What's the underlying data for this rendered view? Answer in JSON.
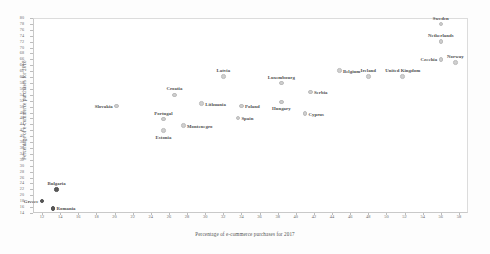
{
  "chart_data": {
    "type": "scatter",
    "title": "",
    "xlabel": "Percentage of e-commerce purchases for 2017",
    "ylabel": "Percentage of e-commerce purchases for 2018",
    "xlim": [
      11,
      59
    ],
    "ylim": [
      14,
      80
    ],
    "grid": false,
    "legend": null,
    "xticks": [
      12,
      14,
      16,
      18,
      20,
      22,
      24,
      26,
      28,
      30,
      32,
      34,
      36,
      38,
      40,
      42,
      44,
      46,
      48,
      50,
      52,
      54,
      56,
      58
    ],
    "yticks": [
      14,
      16,
      18,
      20,
      22,
      24,
      26,
      28,
      30,
      32,
      34,
      36,
      38,
      40,
      42,
      44,
      46,
      48,
      50,
      52,
      54,
      56,
      58,
      60,
      62,
      64,
      66,
      68,
      70,
      72,
      74,
      76,
      78,
      80
    ],
    "marker_color": "#cfcfcf",
    "label_color": "#4f4f4f",
    "points": [
      {
        "label": "Sweden",
        "x": 56.0,
        "y": 78.0,
        "pos": "above",
        "dark": false
      },
      {
        "label": "Netherlands",
        "x": 56.0,
        "y": 72.0,
        "pos": "above",
        "dark": false
      },
      {
        "label": "Czechia",
        "x": 56.0,
        "y": 66.0,
        "pos": "left",
        "dark": false
      },
      {
        "label": "Norway",
        "x": 57.6,
        "y": 65.0,
        "pos": "above",
        "dark": false
      },
      {
        "label": "United Kingdom",
        "x": 51.8,
        "y": 60.2,
        "pos": "above",
        "dark": false
      },
      {
        "label": "Ireland",
        "x": 48.0,
        "y": 60.2,
        "pos": "above",
        "dark": false
      },
      {
        "label": "Belgium",
        "x": 44.8,
        "y": 62.2,
        "pos": "right",
        "dark": false
      },
      {
        "label": "Luxembourg",
        "x": 38.4,
        "y": 58.0,
        "pos": "above",
        "dark": false
      },
      {
        "label": "Serbia",
        "x": 41.6,
        "y": 55.0,
        "pos": "right",
        "dark": false
      },
      {
        "label": "Hungary",
        "x": 38.4,
        "y": 51.6,
        "pos": "below",
        "dark": false
      },
      {
        "label": "Cyprus",
        "x": 41.0,
        "y": 47.6,
        "pos": "right",
        "dark": false
      },
      {
        "label": "Latvia",
        "x": 32.0,
        "y": 60.2,
        "pos": "above",
        "dark": false
      },
      {
        "label": "Croatia",
        "x": 26.6,
        "y": 54.0,
        "pos": "above",
        "dark": false
      },
      {
        "label": "Lithuania",
        "x": 29.6,
        "y": 51.0,
        "pos": "right",
        "dark": false
      },
      {
        "label": "Poland",
        "x": 34.0,
        "y": 50.2,
        "pos": "right",
        "dark": false
      },
      {
        "label": "Slovakia",
        "x": 20.2,
        "y": 50.2,
        "pos": "left",
        "dark": false
      },
      {
        "label": "Spain",
        "x": 33.6,
        "y": 46.2,
        "pos": "right",
        "dark": false
      },
      {
        "label": "Portugal",
        "x": 25.4,
        "y": 45.8,
        "pos": "above",
        "dark": false
      },
      {
        "label": "Montenegro",
        "x": 27.6,
        "y": 43.6,
        "pos": "right",
        "dark": false
      },
      {
        "label": "Estonia",
        "x": 25.4,
        "y": 42.0,
        "pos": "below",
        "dark": false
      },
      {
        "label": "Bulgaria",
        "x": 13.6,
        "y": 22.0,
        "pos": "above",
        "dark": true
      },
      {
        "label": "Greece",
        "x": 12.0,
        "y": 18.0,
        "pos": "left",
        "dark": true
      },
      {
        "label": "Romania",
        "x": 13.2,
        "y": 15.6,
        "pos": "right",
        "dark": true
      }
    ]
  }
}
